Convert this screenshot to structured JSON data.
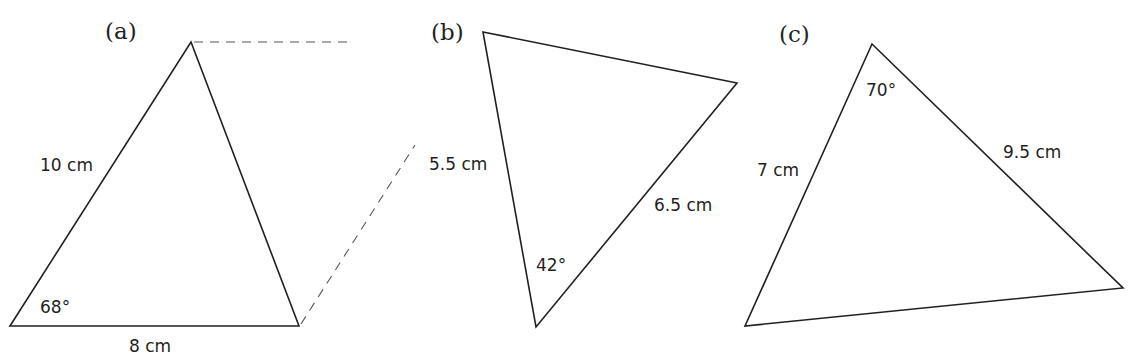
{
  "figures": [
    {
      "id": "a",
      "label": "(a)",
      "vertices": [
        [
          191,
          42
        ],
        [
          299,
          326
        ],
        [
          10,
          326
        ]
      ],
      "side_labels": [
        "10 cm",
        "8 cm"
      ],
      "angle_label": "68°",
      "dashed_lines": [
        [
          [
            194,
            42
          ],
          [
            350,
            42
          ]
        ],
        [
          [
            301,
            324
          ],
          [
            415,
            145
          ]
        ]
      ]
    },
    {
      "id": "b",
      "label": "(b)",
      "vertices": [
        [
          483,
          32
        ],
        [
          737,
          83
        ],
        [
          536,
          327
        ]
      ],
      "side_labels": [
        "5.5 cm",
        "6.5 cm"
      ],
      "angle_label": "42°"
    },
    {
      "id": "c",
      "label": "(c)",
      "vertices": [
        [
          872,
          44
        ],
        [
          1123,
          288
        ],
        [
          745,
          326
        ]
      ],
      "side_labels": [
        "7 cm",
        "9.5 cm"
      ],
      "angle_label": "70°"
    }
  ]
}
